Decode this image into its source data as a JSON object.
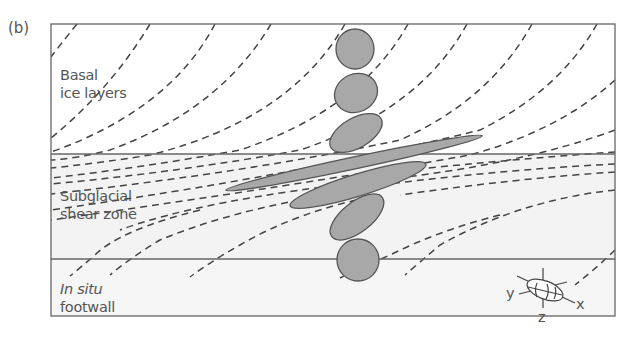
{
  "figure": {
    "panel_label": "(b)",
    "zones": [
      {
        "id": "basal-ice",
        "label_line1": "Basal",
        "label_line2": "ice layers"
      },
      {
        "id": "shear-zone",
        "label_line1": "Subglacial",
        "label_line2": "shear zone"
      },
      {
        "id": "footwall",
        "label_line1": "In situ",
        "label_line2": "footwall"
      }
    ],
    "axes_glyph": {
      "x": "x",
      "y": "y",
      "z": "z"
    },
    "colors": {
      "frame": "#666666",
      "dash": "#444444",
      "clast_fill": "#a8a8a8",
      "clast_stroke": "#555555",
      "shear_zone_fill": "#f3f3f3",
      "footwall_fill": "#f6f6f6",
      "text": "#555555"
    }
  }
}
